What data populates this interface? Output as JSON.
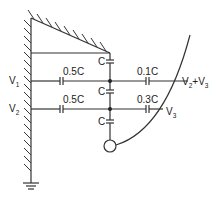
{
  "diagram": {
    "type": "capacitor-network",
    "colors": {
      "line": "#333333",
      "background": "#ffffff"
    },
    "labels": {
      "v1": {
        "main": "V",
        "sub": "1"
      },
      "v2": {
        "main": "V",
        "sub": "2"
      },
      "v3": {
        "main": "V",
        "sub": "3"
      },
      "v2_plus_v3": {
        "main1": "V",
        "sub1": "2",
        "plus": "+V",
        "sub2": "3"
      }
    },
    "capacitors": {
      "left_top": "0.5C",
      "left_bottom": "0.5C",
      "right_top": "0.1C",
      "right_bottom": "0.3C",
      "center_1": "C",
      "center_2": "C",
      "center_3": "C"
    },
    "elements": [
      "hatched grounded wall (left)",
      "hatched slanted wall (top)",
      "ground symbol",
      "sphere/electrode (circle)",
      "curved trajectory line"
    ]
  }
}
